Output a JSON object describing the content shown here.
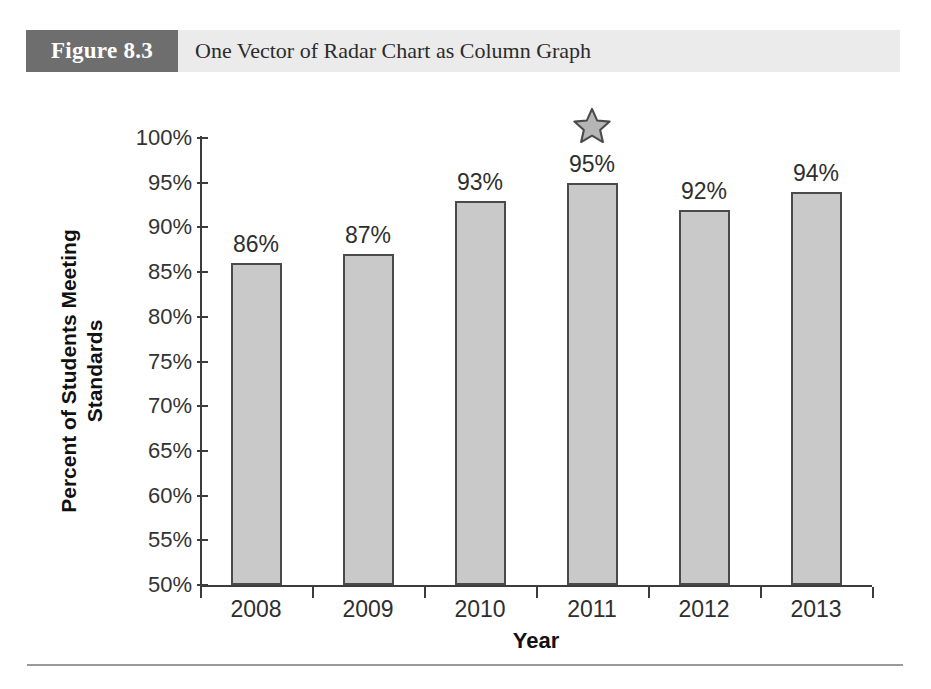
{
  "figure": {
    "number_label": "Figure 8.3",
    "caption": "One Vector of Radar Chart as Column Graph",
    "number_box_color": "#6e6e6e",
    "caption_band_color": "#ebebeb"
  },
  "chart_data": {
    "type": "bar",
    "title": "One Vector of Radar Chart as Column Graph",
    "xlabel": "Year",
    "ylabel": "Percent of Students Meeting Standards",
    "ylabel_lines": [
      "Percent of Students Meeting",
      "Standards"
    ],
    "categories": [
      "2008",
      "2009",
      "2010",
      "2011",
      "2012",
      "2013"
    ],
    "values": [
      86,
      87,
      93,
      95,
      92,
      94
    ],
    "data_labels": [
      "86%",
      "87%",
      "93%",
      "95%",
      "92%",
      "94%"
    ],
    "ylim": [
      50,
      100
    ],
    "ytick_values": [
      100,
      95,
      90,
      85,
      80,
      75,
      70,
      65,
      60,
      55,
      50
    ],
    "ytick_labels": [
      "100%",
      "95%",
      "90%",
      "85%",
      "80%",
      "75%",
      "70%",
      "65%",
      "60%",
      "55%",
      "50%"
    ],
    "grid": false,
    "legend": "none",
    "bar_fill_color": "#c9c9c9",
    "bar_border_color": "#4a4a4a",
    "axis_color": "#3c3c3c",
    "annotations": [
      {
        "type": "star",
        "category": "2011",
        "value": 95,
        "icon": "star-icon",
        "fill_color": "#b5b5b5",
        "border_color": "#4a4a4a"
      }
    ]
  }
}
